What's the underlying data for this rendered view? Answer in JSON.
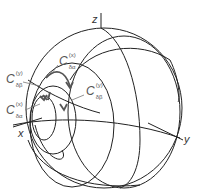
{
  "diagram": {
    "type": "sphere-rotation-diagram",
    "colors": {
      "sphere_lines": "#222222",
      "path_lines": "#555555",
      "labels": "#555555"
    },
    "axes": {
      "z": "z",
      "x": "x",
      "y": "y"
    },
    "labels": [
      {
        "id": "c-da-x-top",
        "base": "C",
        "sup": "(x)",
        "sub": "δα"
      },
      {
        "id": "c-db-y-left",
        "base": "C",
        "sup": "(y)",
        "sub": "δβ"
      },
      {
        "id": "c-db-y-right",
        "base": "C",
        "sup": "(y)",
        "sub": "δβ"
      },
      {
        "id": "c-da-x-bottom",
        "base": "C",
        "sup": "(x)",
        "sub": "δα"
      }
    ]
  }
}
